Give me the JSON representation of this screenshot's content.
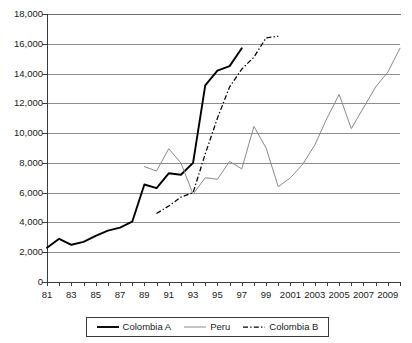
{
  "chart_data": {
    "type": "line",
    "title": "",
    "xlabel": "",
    "ylabel": "",
    "xlim": [
      1981,
      2010
    ],
    "ylim": [
      0,
      18000
    ],
    "grid": true,
    "legend_position": "bottom",
    "y_ticks": [
      0,
      2000,
      4000,
      6000,
      8000,
      10000,
      12000,
      14000,
      16000,
      18000
    ],
    "y_tick_labels": [
      "0",
      "2,000",
      "4,000",
      "6,000",
      "8,000",
      "10,000",
      "12,000",
      "14,000",
      "16,000",
      "18,000"
    ],
    "x_ticks": [
      1981,
      1982,
      1983,
      1984,
      1985,
      1986,
      1987,
      1988,
      1989,
      1990,
      1991,
      1992,
      1993,
      1994,
      1995,
      1996,
      1997,
      1998,
      1999,
      2000,
      2001,
      2002,
      2003,
      2004,
      2005,
      2006,
      2007,
      2008,
      2009,
      2010
    ],
    "x_tick_labels": [
      "81",
      "",
      "83",
      "",
      "85",
      "",
      "87",
      "",
      "89",
      "",
      "91",
      "",
      "93",
      "",
      "95",
      "",
      "97",
      "",
      "99",
      "",
      "2001",
      "",
      "2003",
      "",
      "2005",
      "",
      "2007",
      "",
      "2009",
      ""
    ],
    "series": [
      {
        "name": "Colombia A",
        "style": "solid-thick",
        "color": "#000000",
        "x": [
          1981,
          1982,
          1983,
          1984,
          1985,
          1986,
          1987,
          1988,
          1989,
          1990,
          1991,
          1992,
          1993,
          1994,
          1995,
          1996,
          1997
        ],
        "values": [
          2300,
          2900,
          2500,
          2700,
          3100,
          3450,
          3650,
          4050,
          6550,
          6300,
          7300,
          7200,
          8000,
          13200,
          14200,
          14500,
          15700
        ]
      },
      {
        "name": "Peru",
        "style": "solid-thin",
        "color": "#8a8a8a",
        "x": [
          1989,
          1990,
          1991,
          1992,
          1993,
          1994,
          1995,
          1996,
          1997,
          1998,
          1999,
          2000,
          2001,
          2002,
          2003,
          2004,
          2005,
          2006,
          2007,
          2008,
          2009,
          2010
        ],
        "values": [
          7750,
          7450,
          8950,
          8000,
          5900,
          7000,
          6900,
          8100,
          7600,
          10450,
          9000,
          6400,
          7000,
          7900,
          9200,
          11000,
          12600,
          10300,
          11700,
          13100,
          14100,
          15700
        ]
      },
      {
        "name": "Colombia B",
        "style": "dash-dot",
        "color": "#000000",
        "x": [
          1990,
          1991,
          1992,
          1993,
          1994,
          1995,
          1996,
          1997,
          1998,
          1999,
          2000
        ],
        "values": [
          4600,
          5100,
          5700,
          6000,
          8600,
          11000,
          13100,
          14300,
          15100,
          16400,
          16500
        ]
      }
    ]
  },
  "legend": {
    "items": [
      {
        "label": "Colombia A",
        "style": "solid-thick"
      },
      {
        "label": "Peru",
        "style": "solid-thin"
      },
      {
        "label": "Colombia B",
        "style": "dash-dot"
      }
    ]
  },
  "colors": {
    "series_a": "#000000",
    "series_b": "#8a8a8a",
    "series_c": "#000000",
    "grid": "#8c8c8c",
    "axis": "#3a3a3a",
    "background": "#ffffff"
  }
}
